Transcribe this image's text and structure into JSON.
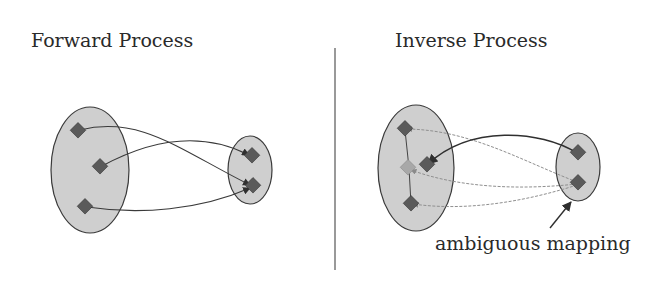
{
  "panels": {
    "forward": {
      "title": "Forward Process"
    },
    "inverse": {
      "title": "Inverse Process",
      "annotation": "ambiguous mapping"
    }
  },
  "colors": {
    "set_fill": "#cfcfcf",
    "set_stroke": "#3a3a3a",
    "node_fill": "#5a5a5a",
    "arrow_solid": "#3a3a3a",
    "arrow_faint": "#9a9a9a",
    "divider": "#555555"
  }
}
